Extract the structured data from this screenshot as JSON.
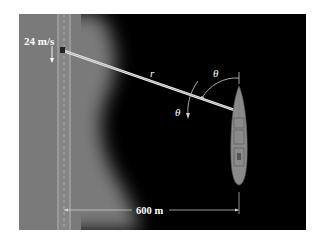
{
  "figure": {
    "labels": {
      "speed": "24 m/s",
      "beam_length": "r",
      "angle_top": "θ",
      "angle_side": "θ",
      "distance": "600 m"
    },
    "colors": {
      "background": "#ffffff",
      "land": "#7a7a7a",
      "water": "#000000",
      "road_line": "#bcbcbc",
      "beam": "#e6e6e6",
      "boat_hull": "#8a8a8a",
      "text": "#ffffff"
    }
  }
}
